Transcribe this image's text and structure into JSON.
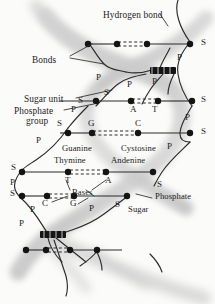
{
  "diagram": {
    "background_color": "#fbfbfa",
    "ink_color": "#1b1b1b",
    "helix_shade_color": "#c9c9c9",
    "callout_labels": [
      {
        "name": "hydrogen-bond",
        "text": "Hydrogen bond",
        "x": 103,
        "y": 11
      },
      {
        "name": "bonds",
        "text": "Bonds",
        "x": 32,
        "y": 56
      },
      {
        "name": "sugar-unit",
        "text": "Sugar unit",
        "x": 24,
        "y": 95
      },
      {
        "name": "phosphate-group-line1",
        "text": "Phosphate",
        "x": 14,
        "y": 107
      },
      {
        "name": "phosphate-group-line2",
        "text": "group",
        "x": 26,
        "y": 117
      },
      {
        "name": "guanine",
        "text": "Guanine",
        "x": 62,
        "y": 144
      },
      {
        "name": "cystosine",
        "text": "Cystosine",
        "x": 121,
        "y": 144
      },
      {
        "name": "thymine",
        "text": "Thymine",
        "x": 54,
        "y": 156
      },
      {
        "name": "andenine",
        "text": "Andenine",
        "x": 111,
        "y": 156
      },
      {
        "name": "bases",
        "text": "Bases",
        "x": 72,
        "y": 193
      },
      {
        "name": "phosphate-right",
        "text": "Phosphate",
        "x": 155,
        "y": 196
      },
      {
        "name": "sugar-right",
        "text": "Sugar",
        "x": 128,
        "y": 208
      }
    ],
    "base_letters": [
      {
        "name": "base-letter-A-top",
        "text": "A",
        "x": 133,
        "y": 110
      },
      {
        "name": "base-letter-T-top",
        "text": "T",
        "x": 154,
        "y": 110
      },
      {
        "name": "base-letter-G-mid",
        "text": "G",
        "x": 91,
        "y": 124
      },
      {
        "name": "base-letter-C-mid",
        "text": "C",
        "x": 136,
        "y": 124
      },
      {
        "name": "base-letter-T-low",
        "text": "T",
        "x": 66,
        "y": 183
      },
      {
        "name": "base-letter-A-low",
        "text": "A",
        "x": 107,
        "y": 183
      },
      {
        "name": "base-letter-C-bot",
        "text": "C",
        "x": 44,
        "y": 202
      },
      {
        "name": "base-letter-G-bot",
        "text": "G",
        "x": 71,
        "y": 202
      }
    ],
    "backbone_letters": [
      {
        "name": "sugar-marker-right-1",
        "text": "S",
        "x": 201,
        "y": 38
      },
      {
        "name": "phosphate-marker-right-1",
        "text": "P",
        "x": 177,
        "y": 57
      },
      {
        "name": "phosphate-marker-center-1",
        "text": "P",
        "x": 98,
        "y": 77
      },
      {
        "name": "phosphate-marker-center-2",
        "text": "P",
        "x": 129,
        "y": 83
      },
      {
        "name": "phosphate-marker-center-3",
        "text": "P",
        "x": 152,
        "y": 80
      },
      {
        "name": "sugar-marker-center-1",
        "text": "S",
        "x": 104,
        "y": 92
      },
      {
        "name": "sugar-marker-left-1",
        "text": "S",
        "x": 78,
        "y": 100
      },
      {
        "name": "sugar-marker-right-2",
        "text": "S",
        "x": 201,
        "y": 101
      },
      {
        "name": "phosphate-marker-left-1",
        "text": "P",
        "x": 71,
        "y": 108
      },
      {
        "name": "phosphate-marker-right-2",
        "text": "P",
        "x": 186,
        "y": 118
      },
      {
        "name": "sugar-marker-left-2",
        "text": "S",
        "x": 58,
        "y": 122
      },
      {
        "name": "sugar-marker-right-3",
        "text": "S",
        "x": 201,
        "y": 137
      },
      {
        "name": "phosphate-marker-left-2",
        "text": "P",
        "x": 37,
        "y": 139
      },
      {
        "name": "phosphate-marker-right-3",
        "text": "P",
        "x": 168,
        "y": 145
      },
      {
        "name": "sugar-marker-left-3",
        "text": "S",
        "x": 13,
        "y": 168
      },
      {
        "name": "sugar-marker-right-4",
        "text": "S",
        "x": 158,
        "y": 185
      },
      {
        "name": "phosphate-marker-left-3",
        "text": "P",
        "x": 11,
        "y": 185
      },
      {
        "name": "sugar-marker-left-4",
        "text": "S",
        "x": 11,
        "y": 196
      },
      {
        "name": "phosphate-marker-center-4",
        "text": "P",
        "x": 90,
        "y": 207
      },
      {
        "name": "phosphate-marker-center-5",
        "text": "P",
        "x": 31,
        "y": 208
      },
      {
        "name": "sugar-marker-center-2",
        "text": "S",
        "x": 116,
        "y": 204
      },
      {
        "name": "phosphate-marker-left-4",
        "text": "P",
        "x": 20,
        "y": 222
      }
    ]
  }
}
